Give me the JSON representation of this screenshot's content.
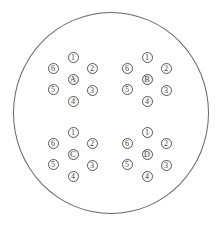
{
  "diagram": {
    "type": "plate-layout",
    "outer_shape": "circle",
    "hole_labels": [
      "1",
      "2",
      "3",
      "4",
      "5",
      "6"
    ],
    "groups": [
      {
        "id": "A",
        "center_label": "A",
        "origin": [
          73,
          79
        ]
      },
      {
        "id": "B",
        "center_label": "B",
        "origin": [
          147,
          79
        ]
      },
      {
        "id": "C",
        "center_label": "C",
        "origin": [
          73,
          154
        ]
      },
      {
        "id": "D",
        "center_label": "D",
        "origin": [
          147,
          154
        ]
      }
    ],
    "hole_offsets": {
      "1": [
        0,
        -22
      ],
      "2": [
        19,
        -11
      ],
      "3": [
        19,
        11
      ],
      "4": [
        0,
        22
      ],
      "5": [
        -20,
        10
      ],
      "6": [
        -20,
        -11
      ]
    },
    "colors": {
      "stroke": "#555555",
      "text": "#444444",
      "background": "#ffffff"
    }
  }
}
